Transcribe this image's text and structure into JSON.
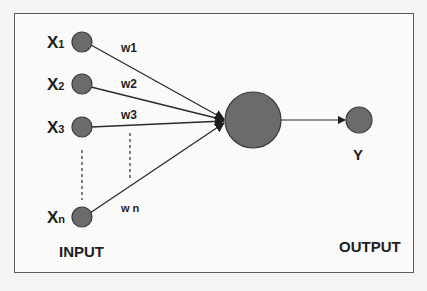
{
  "diagram": {
    "type": "perceptron",
    "inputs": [
      {
        "label": "X",
        "sub": "1",
        "weight": "w1"
      },
      {
        "label": "X",
        "sub": "2",
        "weight": "w2"
      },
      {
        "label": "X",
        "sub": "3",
        "weight": "w3"
      },
      {
        "label": "X",
        "sub": "n",
        "weight": "w n"
      }
    ],
    "output_label": "Y",
    "section_labels": {
      "input": "INPUT",
      "output": "OUTPUT"
    },
    "colors": {
      "node_fill": "#6b6b6b",
      "node_stroke": "#3a3a3a",
      "line": "#2a2a2a",
      "frame": "#5c5c5c"
    }
  }
}
